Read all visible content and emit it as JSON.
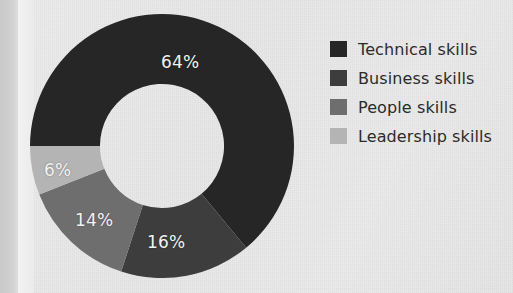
{
  "chart_data": {
    "type": "pie",
    "variant": "donut",
    "title": "",
    "subtitle": "",
    "xlabel": "",
    "ylabel": "",
    "grid": false,
    "legend_position": "right",
    "start_angle_deg": 270,
    "direction": "clockwise",
    "inner_radius_ratio": 0.47,
    "categories": [
      "Technical skills",
      "Business skills",
      "People skills",
      "Leadership skills"
    ],
    "values": [
      64,
      16,
      14,
      6
    ],
    "value_unit": "%",
    "data_labels": [
      "64%",
      "16%",
      "14%",
      "6%"
    ],
    "data_label_color": "#f2f2f2",
    "colors": [
      "#262626",
      "#3d3d3d",
      "#6e6e6e",
      "#b4b4b4"
    ],
    "slices": [
      {
        "label": "Technical skills",
        "value": 64,
        "display": "64%",
        "color": "#262626"
      },
      {
        "label": "Business skills",
        "value": 16,
        "display": "16%",
        "color": "#3d3d3d"
      },
      {
        "label": "People skills",
        "value": 14,
        "display": "14%",
        "color": "#6e6e6e"
      },
      {
        "label": "Leadership skills",
        "value": 6,
        "display": "6%",
        "color": "#b4b4b4"
      }
    ]
  },
  "legend": {
    "items": [
      {
        "label": "Technical skills",
        "color": "#262626"
      },
      {
        "label": "Business skills",
        "color": "#3d3d3d"
      },
      {
        "label": "People skills",
        "color": "#6e6e6e"
      },
      {
        "label": "Leadership skills",
        "color": "#b4b4b4"
      }
    ]
  },
  "labels": {
    "technical": "64%",
    "business": "16%",
    "people": "14%",
    "leadership": "6%"
  },
  "page": {
    "background_color": "#e8e8e8",
    "edge_strip_color": "#cdcdcd",
    "bleed_through_text": "",
    "bleed_through_text_2": ""
  }
}
